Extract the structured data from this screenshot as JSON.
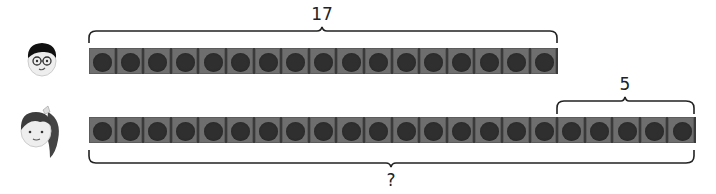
{
  "diagram": {
    "type": "bar-model",
    "rows": [
      {
        "person": "boy",
        "count": 17,
        "top_label": "17"
      },
      {
        "person": "girl",
        "count": 22,
        "extra_count": 5,
        "extra_label": "5",
        "total_label": "?"
      }
    ]
  },
  "colors": {
    "cell": "#6e6e6e",
    "dot": "#2f2f2f",
    "brace": "#222222"
  }
}
